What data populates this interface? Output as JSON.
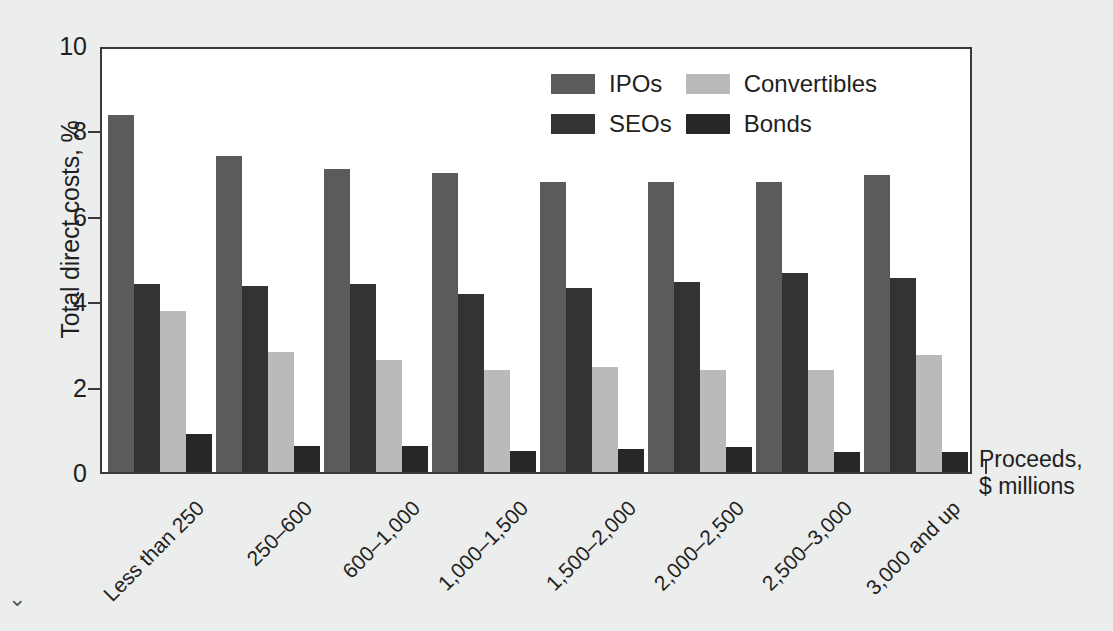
{
  "chart_data": {
    "type": "bar",
    "title": "",
    "xlabel": "Proceeds, $ millions",
    "ylabel": "Total direct costs, %",
    "ylim": [
      0,
      10
    ],
    "yticks": [
      0,
      2,
      4,
      6,
      8,
      10
    ],
    "grid": false,
    "legend_position": "top-center-right",
    "categories": [
      "Less than 250",
      "250–600",
      "600–1,000",
      "1,000–1,500",
      "1,500–2,000",
      "2,000–2,500",
      "2,500–3,000",
      "3,000 and up"
    ],
    "series": [
      {
        "name": "IPOs",
        "color": "#595b5d",
        "values": [
          8.35,
          7.4,
          7.1,
          7.0,
          6.8,
          6.8,
          6.8,
          6.95
        ]
      },
      {
        "name": "SEOs",
        "color": "#313335",
        "values": [
          4.4,
          4.35,
          4.4,
          4.18,
          4.3,
          4.45,
          4.65,
          4.55
        ]
      },
      {
        "name": "Convertibles",
        "color": "#b9babc",
        "values": [
          3.77,
          2.82,
          2.62,
          2.4,
          2.45,
          2.4,
          2.38,
          2.75
        ]
      },
      {
        "name": "Bonds",
        "color": "#252729",
        "values": [
          0.88,
          0.6,
          0.6,
          0.5,
          0.55,
          0.58,
          0.48,
          0.48
        ]
      }
    ]
  },
  "axes": {
    "y_title": "Total direct costs, %",
    "x_title_line1": "Proceeds,",
    "x_title_line2": "$ millions",
    "y_tick_labels": [
      "10",
      "8",
      "6",
      "4",
      "2",
      "0"
    ]
  },
  "legend": {
    "entries": [
      {
        "label": "IPOs",
        "key": "ipos"
      },
      {
        "label": "Convertibles",
        "key": "convertibles"
      },
      {
        "label": "SEOs",
        "key": "seos"
      },
      {
        "label": "Bonds",
        "key": "bonds"
      }
    ]
  },
  "misc": {
    "corner_mark": "⌄"
  }
}
